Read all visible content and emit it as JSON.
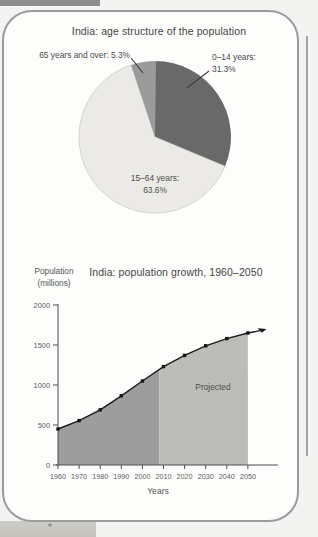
{
  "page": {
    "background": "#f3f3f1",
    "panel_background": "#fdfdfc",
    "panel_border": "#9b9b9b",
    "top_strip_color": "#8d8d8d",
    "page_edge_line_color": "#a3a3a3",
    "photo_fragment_color": "#c8c6c0"
  },
  "chart_data": [
    {
      "type": "pie",
      "title": "India: age structure of the population",
      "direction": "clockwise",
      "start_angle_deg": 0,
      "legend_position": "callout-labels",
      "slices": [
        {
          "id": "0-14",
          "label": "0–14 years:",
          "value_label": "31.3%",
          "value": 31.3,
          "color": "#696969"
        },
        {
          "id": "15-64",
          "label": "15–64 years:",
          "value_label": "63.6%",
          "value": 63.6,
          "color": "#eceae6"
        },
        {
          "id": "65-plus",
          "label": "65 years and over:",
          "value_label": "5.3%",
          "value": 5.3,
          "color": "#9b9b9b"
        }
      ]
    },
    {
      "type": "area",
      "title": "India: population growth, 1960–2050",
      "xlabel": "Years",
      "ylabel_line1": "Population",
      "ylabel_line2": "(millions)",
      "x": [
        1960,
        1970,
        1980,
        1990,
        2000,
        2010,
        2020,
        2030,
        2040,
        2050
      ],
      "values": [
        450,
        555,
        690,
        865,
        1050,
        1230,
        1370,
        1490,
        1580,
        1650
      ],
      "ylim": [
        0,
        2000
      ],
      "yticks": [
        0,
        500,
        1000,
        1500,
        2000
      ],
      "grid": false,
      "projected_from": 2008,
      "projected_label": "Projected",
      "colors": {
        "historical_area": "#9d9d9d",
        "projected_area": "#bcbcb9",
        "line": "#1b1b1b",
        "marker": "#141414",
        "axis": "#4d4d4d",
        "tick_text": "#5c5c5c"
      }
    }
  ]
}
